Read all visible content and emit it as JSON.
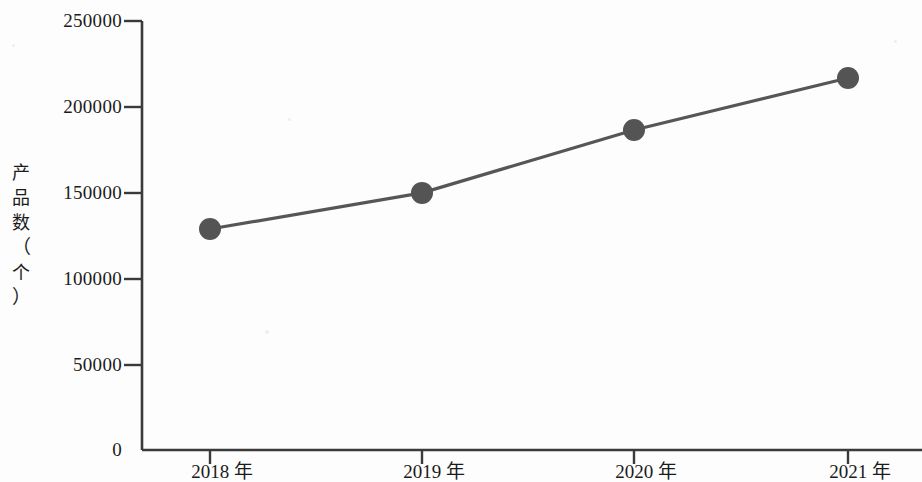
{
  "chart_data": {
    "type": "line",
    "title": "",
    "xlabel": "",
    "ylabel": "产品数（个）",
    "categories": [
      "2018 年",
      "2019 年",
      "2020 年",
      "2021 年"
    ],
    "values": [
      128800,
      149800,
      186500,
      216800
    ],
    "series": [
      {
        "name": "产品数",
        "values": [
          128800,
          149800,
          186500,
          216800
        ]
      }
    ],
    "ylim": [
      0,
      250000
    ],
    "y_ticks": [
      0,
      50000,
      100000,
      150000,
      200000,
      250000
    ],
    "y_tick_labels": [
      "0",
      "50000",
      "100000",
      "150000",
      "200000",
      "250000"
    ],
    "grid": false,
    "legend": false,
    "marker": "circle",
    "line_color": "#565656",
    "marker_color": "#545454",
    "axis_color": "#3a3a3a",
    "background_color": "#fdfdfd"
  },
  "axis_title": {
    "char1": "产",
    "char2": "品",
    "char3": "数",
    "char4": "（",
    "char5": "个",
    "char6": "）"
  }
}
